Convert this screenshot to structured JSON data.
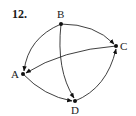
{
  "problem": {
    "number": "12."
  },
  "graph": {
    "directed": true,
    "nodes": [
      {
        "id": "B",
        "label": "B",
        "x": 61,
        "y": 24,
        "lx": 57,
        "ly": 18
      },
      {
        "id": "C",
        "label": "C",
        "x": 116,
        "y": 46,
        "lx": 120,
        "ly": 50
      },
      {
        "id": "A",
        "label": "A",
        "x": 23,
        "y": 74,
        "lx": 11,
        "ly": 78
      },
      {
        "id": "D",
        "label": "D",
        "x": 75,
        "y": 101,
        "lx": 71,
        "ly": 114
      }
    ],
    "edges": [
      {
        "from": "B",
        "to": "C"
      },
      {
        "from": "B",
        "to": "A"
      },
      {
        "from": "B",
        "to": "D"
      },
      {
        "from": "C",
        "to": "A"
      },
      {
        "from": "A",
        "to": "D"
      },
      {
        "from": "D",
        "to": "C"
      }
    ]
  },
  "colors": {
    "ink": "#1a1a1a",
    "background": "#ffffff"
  }
}
